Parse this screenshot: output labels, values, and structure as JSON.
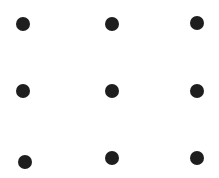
{
  "diagram": {
    "type": "dot-grid",
    "rows": 3,
    "cols": 3,
    "background": "#ffffff",
    "dot_color": "#1e1e1e",
    "dots": [
      {
        "row": 0,
        "col": 0,
        "cx": 23,
        "cy": 24,
        "r": 7
      },
      {
        "row": 0,
        "col": 1,
        "cx": 112,
        "cy": 24,
        "r": 7
      },
      {
        "row": 0,
        "col": 2,
        "cx": 197,
        "cy": 23,
        "r": 7
      },
      {
        "row": 1,
        "col": 0,
        "cx": 23,
        "cy": 91,
        "r": 7
      },
      {
        "row": 1,
        "col": 1,
        "cx": 112,
        "cy": 91,
        "r": 7
      },
      {
        "row": 1,
        "col": 2,
        "cx": 197,
        "cy": 91,
        "r": 7
      },
      {
        "row": 2,
        "col": 0,
        "cx": 25,
        "cy": 162,
        "r": 7
      },
      {
        "row": 2,
        "col": 1,
        "cx": 112,
        "cy": 158,
        "r": 7
      },
      {
        "row": 2,
        "col": 2,
        "cx": 197,
        "cy": 158,
        "r": 7
      }
    ]
  }
}
